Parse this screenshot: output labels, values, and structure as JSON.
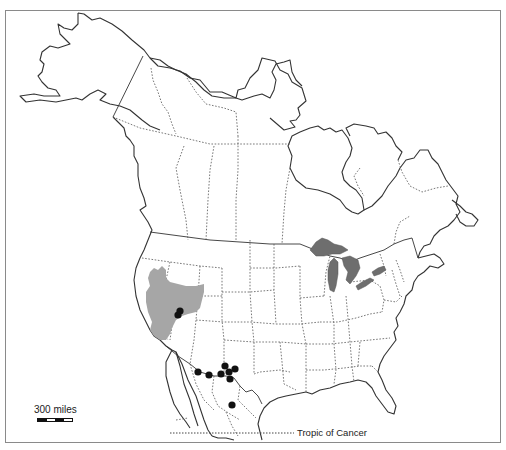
{
  "figure": {
    "type": "species range map",
    "region": "North America"
  },
  "legend": {
    "scale_label": "300 miles",
    "scale_segments": [
      "black",
      "white",
      "black",
      "white"
    ],
    "tropic_label": "Tropic of Cancer"
  },
  "colors": {
    "frame": "#8a8a8a",
    "coastline": "#333333",
    "range_fill": "#a6a6a6",
    "lakes_fill": "#6e6e6e",
    "occurrence_dot": "#111111"
  },
  "features": {
    "range_area": "Great Basin (Nevada / western Utah / eastern California)",
    "occurrence_points": [
      {
        "x": 180,
        "y": 311,
        "area": "central Nevada"
      },
      {
        "x": 178,
        "y": 315,
        "area": "central Nevada"
      },
      {
        "x": 198,
        "y": 373,
        "area": "southern Arizona"
      },
      {
        "x": 209,
        "y": 375,
        "area": "southern Arizona"
      },
      {
        "x": 221,
        "y": 374,
        "area": "SW New Mexico"
      },
      {
        "x": 225,
        "y": 366,
        "area": "SW New Mexico"
      },
      {
        "x": 235,
        "y": 369,
        "area": "SW New Mexico"
      },
      {
        "x": 229,
        "y": 372,
        "area": "SW New Mexico"
      },
      {
        "x": 230,
        "y": 379,
        "area": "Chihuahua"
      },
      {
        "x": 232,
        "y": 405,
        "area": "Chihuahua / Durango"
      }
    ],
    "great_lakes": true
  }
}
